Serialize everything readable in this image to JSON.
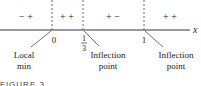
{
  "axis": {
    "variable": "x"
  },
  "intervals": [
    {
      "signs": "− +"
    },
    {
      "signs": "+ +"
    },
    {
      "signs": "+ −"
    },
    {
      "signs": "+ +"
    }
  ],
  "critical_points": [
    {
      "label": "0",
      "annotation_line1": "Local",
      "annotation_line2": "min"
    },
    {
      "label_num": "1",
      "label_den": "3",
      "annotation_line1": "Inflection",
      "annotation_line2": "point"
    },
    {
      "label": "1",
      "annotation_line1": "Inflection",
      "annotation_line2": "point"
    }
  ],
  "caption": "FIGURE 3"
}
